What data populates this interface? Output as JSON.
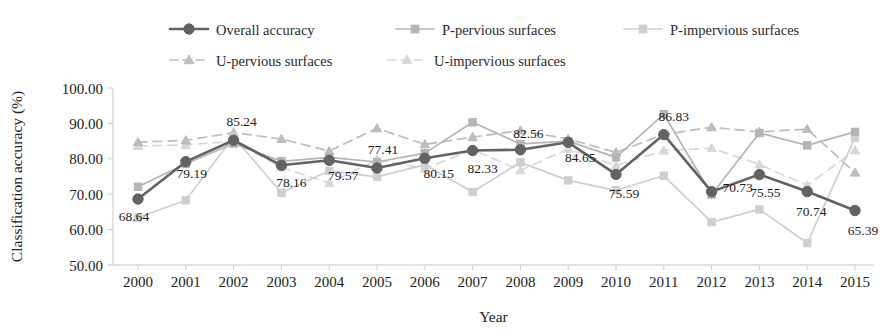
{
  "chart_data": {
    "type": "line",
    "title": "",
    "xlabel": "Year",
    "ylabel": "Classification accuracy (%)",
    "x": [
      2000,
      2001,
      2002,
      2003,
      2004,
      2005,
      2006,
      2007,
      2008,
      2009,
      2010,
      2011,
      2012,
      2013,
      2014,
      2015
    ],
    "categories": [
      "2000",
      "2001",
      "2002",
      "2003",
      "2004",
      "2005",
      "2006",
      "2007",
      "2008",
      "2009",
      "2010",
      "2011",
      "2012",
      "2013",
      "2014",
      "2015"
    ],
    "xlim": [
      2000,
      2015
    ],
    "ylim": [
      50.0,
      100.0
    ],
    "yticks": [
      50.0,
      60.0,
      70.0,
      80.0,
      90.0,
      100.0
    ],
    "ytick_labels": [
      "50.00",
      "60.00",
      "70.00",
      "80.00",
      "90.00",
      "100.00"
    ],
    "grid": false,
    "legend_position": "top-center",
    "series": [
      {
        "name": "Overall accuracy",
        "marker": "circle",
        "line": "solid",
        "color": "#636363",
        "values": [
          68.64,
          79.19,
          85.24,
          78.16,
          79.57,
          77.41,
          80.15,
          82.33,
          82.56,
          84.65,
          75.59,
          86.83,
          70.73,
          75.55,
          70.74,
          65.39
        ],
        "point_labels": [
          "68.64",
          "79.19",
          "85.24",
          "78.16",
          "79.57",
          "77.41",
          "80.15",
          "82.33",
          "82.56",
          "84.65",
          "75.59",
          "86.83",
          "70.73",
          "75.55",
          "70.74",
          "65.39"
        ]
      },
      {
        "name": "P-pervious surfaces",
        "marker": "square",
        "line": "solid",
        "color": "#b5b5b5",
        "values": [
          72.1,
          78.6,
          84.3,
          79.3,
          80.4,
          79.1,
          81.6,
          90.3,
          84.2,
          85.0,
          80.4,
          92.6,
          69.9,
          87.3,
          83.8,
          87.6
        ]
      },
      {
        "name": "P-impervious surfaces",
        "marker": "square",
        "line": "solid",
        "color": "#cfcfcf",
        "values": [
          63.4,
          68.3,
          86.2,
          70.4,
          76.6,
          74.9,
          78.3,
          70.6,
          79.0,
          73.9,
          71.1,
          75.2,
          62.1,
          65.7,
          56.2,
          86.0
        ]
      },
      {
        "name": "U-pervious surfaces",
        "marker": "triangle",
        "line": "dashed",
        "color": "#bdbdbd",
        "values": [
          84.7,
          85.2,
          87.4,
          85.6,
          82.2,
          88.6,
          84.1,
          86.1,
          88.0,
          85.6,
          81.8,
          86.9,
          88.9,
          87.6,
          88.4,
          76.1
        ]
      },
      {
        "name": "U-impervious surfaces",
        "marker": "triangle",
        "line": "dashed",
        "color": "#d8d8d8",
        "values": [
          83.6,
          83.9,
          85.0,
          77.6,
          73.1,
          79.7,
          77.2,
          82.6,
          76.7,
          82.8,
          78.1,
          82.3,
          83.0,
          78.4,
          72.5,
          82.4
        ]
      }
    ]
  },
  "legend": {
    "items": [
      {
        "label": "Overall accuracy"
      },
      {
        "label": "P-pervious surfaces"
      },
      {
        "label": "P-impervious surfaces"
      },
      {
        "label": "U-pervious surfaces"
      },
      {
        "label": "U-impervious surfaces"
      }
    ]
  },
  "axes": {
    "y_title": "Classification accuracy (%)",
    "x_title": "Year"
  }
}
